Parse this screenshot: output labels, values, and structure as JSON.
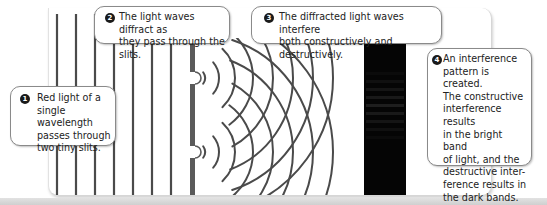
{
  "diagram": {
    "colors": {
      "line": "#4a4a4a",
      "barrier": "#5a5a5a",
      "screen": "#050505",
      "callout_border": "#8a8a8a",
      "badge": "#1a1a1a"
    },
    "incident_waves_x": [
      57,
      76,
      95,
      114,
      133,
      152,
      171
    ],
    "barrier": {
      "x": 190,
      "width": 5,
      "top": 38,
      "bottom": 195,
      "slits_y": [
        78,
        152
      ]
    },
    "screen": {
      "x": 364,
      "width": 42,
      "top": 38,
      "bottom": 195
    },
    "arc_radii": [
      10,
      24,
      40,
      58,
      78,
      98,
      118,
      138
    ],
    "callouts": [
      {
        "number": "1",
        "text": "Red light of a\nsingle wavelength\npasses through\ntwo tiny slits."
      },
      {
        "number": "2",
        "text": "The light waves diffract as\nthey pass through the slits."
      },
      {
        "number": "3",
        "text": "The diffracted light waves interfere\nboth constructively and destructively."
      },
      {
        "number": "4",
        "text": "An interference\npattern is created.\nThe constructive\ninterference results\nin the bright band\nof light, and the\ndestructive inter-\nference results in\nthe dark bands."
      }
    ]
  }
}
